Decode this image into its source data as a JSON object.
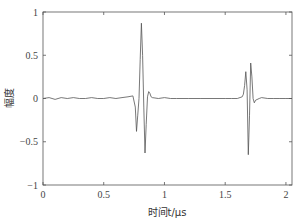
{
  "chart_data": {
    "type": "line",
    "title": "",
    "xlabel": "时间t/μs",
    "ylabel": "幅度",
    "xlim": [
      0,
      2.05
    ],
    "ylim": [
      -1,
      1
    ],
    "xticks": [
      0,
      0.5,
      1,
      1.5,
      2
    ],
    "xtick_labels": [
      "0",
      "0.5",
      "1",
      "1.5",
      "2"
    ],
    "yticks": [
      1,
      0.5,
      0,
      -0.5,
      -1
    ],
    "ytick_labels": [
      "1",
      "0.5",
      "0",
      "−0.5",
      "−1"
    ],
    "grid": false,
    "legend": null,
    "line_color": "#555555",
    "series": [
      {
        "name": "signal",
        "x": [
          0.0,
          0.05,
          0.1,
          0.15,
          0.2,
          0.25,
          0.3,
          0.35,
          0.4,
          0.45,
          0.5,
          0.55,
          0.6,
          0.65,
          0.7,
          0.74,
          0.76,
          0.77,
          0.78,
          0.79,
          0.8,
          0.81,
          0.82,
          0.83,
          0.84,
          0.85,
          0.86,
          0.87,
          0.88,
          0.89,
          0.9,
          0.95,
          1.0,
          1.05,
          1.1,
          1.2,
          1.3,
          1.4,
          1.5,
          1.55,
          1.6,
          1.64,
          1.65,
          1.66,
          1.67,
          1.68,
          1.69,
          1.7,
          1.71,
          1.72,
          1.73,
          1.74,
          1.75,
          1.78,
          1.8,
          1.85,
          1.9,
          1.95,
          2.0,
          2.05
        ],
        "y": [
          0.0,
          0.01,
          -0.01,
          0.01,
          0.0,
          0.01,
          0.0,
          0.0,
          0.01,
          0.0,
          0.0,
          0.01,
          0.0,
          0.01,
          0.02,
          0.03,
          -0.1,
          -0.38,
          -0.2,
          0.0,
          0.45,
          0.87,
          0.5,
          -0.1,
          -0.63,
          -0.3,
          0.02,
          0.08,
          0.06,
          0.02,
          0.01,
          0.0,
          0.01,
          0.0,
          0.0,
          0.0,
          0.0,
          0.0,
          0.0,
          0.0,
          0.0,
          0.02,
          0.05,
          0.15,
          0.31,
          0.1,
          -0.65,
          -0.2,
          0.41,
          0.25,
          0.0,
          -0.05,
          -0.02,
          0.0,
          0.01,
          0.0,
          0.0,
          0.0,
          0.0,
          0.0
        ]
      }
    ]
  }
}
